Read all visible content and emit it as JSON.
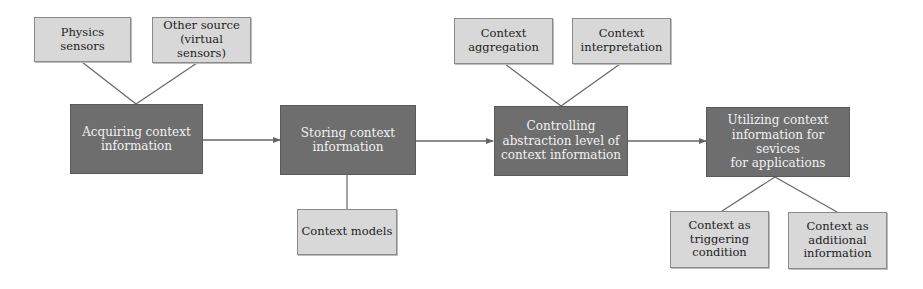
{
  "colors": {
    "process_fill": "#6e6e6e",
    "process_text": "#f2f2f2",
    "detail_fill": "#d8d8d8",
    "detail_text": "#222222",
    "line": "#666666"
  },
  "process_steps": [
    {
      "id": "acquire",
      "label": "Acquiring context\ninformation"
    },
    {
      "id": "store",
      "label": "Storing context\ninformation"
    },
    {
      "id": "control",
      "label": "Controlling\nabstraction level of\ncontext information"
    },
    {
      "id": "utilize",
      "label": "Utilizing context\ninformation for sevices\nfor applications"
    }
  ],
  "details": {
    "acquire": [
      {
        "label": "Physics sensors"
      },
      {
        "label": "Other source\n(virtual sensors)"
      }
    ],
    "store": [
      {
        "label": "Context models"
      }
    ],
    "control": [
      {
        "label": "Context\naggregation"
      },
      {
        "label": "Context\ninterpretation"
      }
    ],
    "utilize": [
      {
        "label": "Context as\ntriggering\ncondition"
      },
      {
        "label": "Context as\nadditional\ninformation"
      }
    ]
  }
}
